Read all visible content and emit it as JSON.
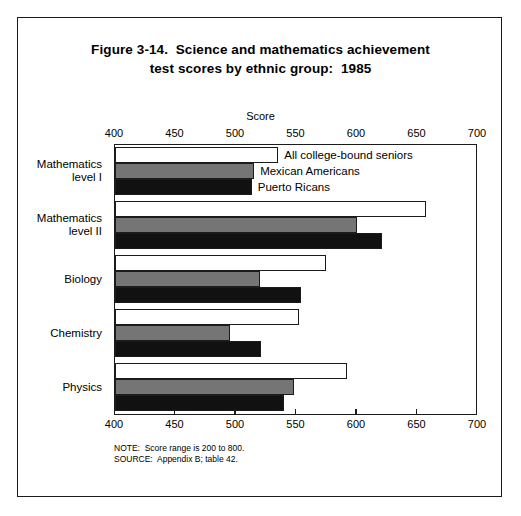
{
  "figure": {
    "title_line1": "Figure 3-14.  Science and mathematics achievement",
    "title_line2": "test scores by ethnic group:  1985",
    "axis_caption": "Score",
    "note": "NOTE:  Score range is 200 to 800.",
    "source": "SOURCE:  Appendix B; table 42."
  },
  "chart_data": {
    "type": "bar",
    "orientation": "horizontal",
    "title": "Figure 3-14.  Science and mathematics achievement test scores by ethnic group:  1985",
    "xlabel": "Score",
    "ylabel": "",
    "xlim": [
      400,
      700
    ],
    "xticks": [
      400,
      450,
      500,
      550,
      600,
      650,
      700
    ],
    "xtick_labels": [
      "400",
      "450",
      "500",
      "550",
      "600",
      "650",
      "700"
    ],
    "grid": false,
    "legend_position": "inline-first-group",
    "categories": [
      "Mathematics\nlevel I",
      "Mathematics\nlevel II",
      "Biology",
      "Chemistry",
      "Physics"
    ],
    "category_labels": [
      "Mathematics\nlevel I",
      "Mathematics\nlevel II",
      "Biology",
      "Chemistry",
      "Physics"
    ],
    "series": [
      {
        "name": "All college-bound seniors",
        "color": "#ffffff",
        "values": [
          535,
          657,
          574,
          552,
          592
        ]
      },
      {
        "name": "Mexican Americans",
        "color": "#757575",
        "values": [
          515,
          600,
          520,
          495,
          548
        ]
      },
      {
        "name": "Puerto Ricans",
        "color": "#111111",
        "values": [
          513,
          621,
          554,
          521,
          540
        ]
      }
    ],
    "annotations": [
      "NOTE:  Score range is 200 to 800.",
      "SOURCE:  Appendix B; table 42."
    ]
  }
}
